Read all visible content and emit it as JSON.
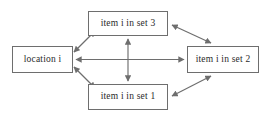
{
  "diagram": {
    "type": "node-edge-graph",
    "background_color": "#ffffff",
    "line_color": "#6e6e6e",
    "text_color": "#2b2b2b",
    "nodes": [
      {
        "id": "location",
        "label": "location i"
      },
      {
        "id": "set3",
        "label": "item i in set 3"
      },
      {
        "id": "set2",
        "label": "item i in set 2"
      },
      {
        "id": "set1",
        "label": "item i in set 1"
      }
    ],
    "edges": [
      {
        "from": "location",
        "to": "set3",
        "arrow": "double"
      },
      {
        "from": "location",
        "to": "set1",
        "arrow": "double"
      },
      {
        "from": "location",
        "to": "set2",
        "arrow": "double"
      },
      {
        "from": "set3",
        "to": "set1",
        "arrow": "double"
      },
      {
        "from": "set3",
        "to": "set2",
        "arrow": "double"
      },
      {
        "from": "set1",
        "to": "set2",
        "arrow": "double"
      }
    ]
  }
}
